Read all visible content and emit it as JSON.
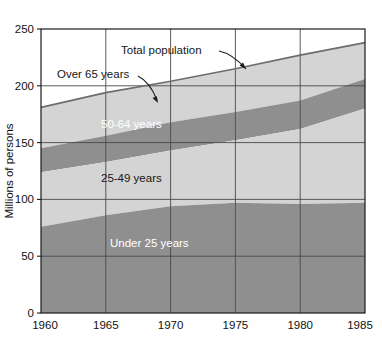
{
  "chart_data": {
    "type": "area",
    "title": "",
    "subtitle": "",
    "xlabel": "",
    "ylabel": "Millions of persons",
    "x": [
      1960,
      1965,
      1970,
      1975,
      1980,
      1985
    ],
    "xlim": [
      1960,
      1985
    ],
    "ylim": [
      0,
      250
    ],
    "xticks": [
      "1960",
      "1965",
      "1970",
      "1975",
      "1980",
      "1985"
    ],
    "yticks": [
      "0",
      "50",
      "100",
      "150",
      "200",
      "250"
    ],
    "grid": true,
    "legend_position": "inline-annotations",
    "stacked": true,
    "series": [
      {
        "name": "Under 25 years",
        "color": "#8f8f8f",
        "values": [
          76,
          86,
          94,
          97,
          96,
          97
        ]
      },
      {
        "name": "25-49 years",
        "color": "#d4d4d4",
        "values": [
          48,
          47,
          49,
          55,
          66,
          83
        ]
      },
      {
        "name": "50-64 years",
        "color": "#8f8f8f",
        "values": [
          21,
          23,
          25,
          25,
          25,
          26
        ]
      },
      {
        "name": "Over 65 years",
        "color": "#d4d4d4",
        "values": [
          16,
          18,
          20,
          22,
          25,
          28
        ]
      }
    ],
    "cumulative": {
      "under_25": [
        76,
        86,
        94,
        97,
        96,
        97
      ],
      "through_25_49": [
        124,
        133,
        143,
        152,
        162,
        180
      ],
      "through_50_64": [
        145,
        156,
        168,
        177,
        187,
        206
      ],
      "total_population": [
        181,
        194,
        204,
        215,
        227,
        238
      ]
    },
    "annotations": [
      {
        "id": "total-population",
        "label": "Total population",
        "style": "dark",
        "arrow": true
      },
      {
        "id": "over-65-years",
        "label": "Over 65 years",
        "style": "dark",
        "arrow": true
      },
      {
        "id": "band-50-64",
        "label": "50-64 years",
        "style": "light",
        "arrow": false
      },
      {
        "id": "band-25-49",
        "label": "25-49 years",
        "style": "dark",
        "arrow": false
      },
      {
        "id": "band-under-25",
        "label": "Under 25 years",
        "style": "light",
        "arrow": false
      }
    ],
    "colors": {
      "band_dark": "#8f8f8f",
      "band_light": "#d4d4d4",
      "total_line": "#6d6d6d",
      "grid": "#4a4a4a",
      "frame": "#1a1a1a",
      "background": "#ffffff"
    }
  }
}
